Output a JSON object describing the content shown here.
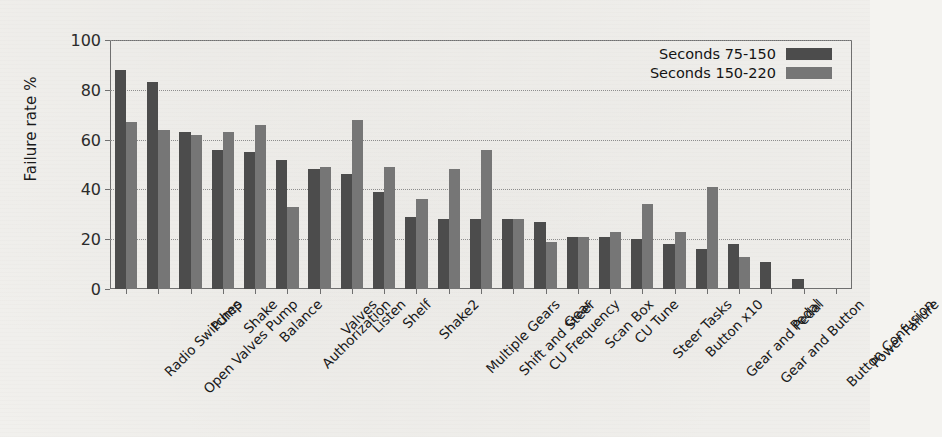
{
  "chart_data": {
    "type": "bar",
    "title": "",
    "xlabel": "",
    "ylabel": "Failure rate %",
    "ylim": [
      0,
      100
    ],
    "yticks": [
      0,
      20,
      40,
      60,
      80,
      100
    ],
    "grid": true,
    "legend_position": "top-right",
    "categories": [
      "Radio Switches",
      "Open Valves Pump",
      "Pump",
      "Shake",
      "Balance",
      "Authorization",
      "Valves",
      "Listen",
      "Shelf",
      "Shake2",
      "Multiple Gears",
      "Shift and Steer",
      "CU Frequency",
      "Gear",
      "Scan Box",
      "CU Tune",
      "Steer Tasks",
      "Button x10",
      "Gear and Pedal",
      "Gear and Button",
      "Pedal",
      "Button Confusion",
      "Power Failure"
    ],
    "series": [
      {
        "name": "Seconds 75-150",
        "color": "#4c4c4c",
        "values": [
          88,
          83,
          63,
          56,
          55,
          52,
          48,
          46,
          39,
          29,
          28,
          28,
          28,
          27,
          21,
          21,
          20,
          18,
          16,
          18,
          11,
          4,
          0
        ]
      },
      {
        "name": "Seconds 150-220",
        "color": "#767676",
        "values": [
          67,
          64,
          62,
          63,
          66,
          33,
          49,
          68,
          49,
          36,
          48,
          56,
          28,
          19,
          21,
          23,
          34,
          23,
          41,
          13,
          0,
          0,
          0
        ]
      }
    ]
  },
  "legend": {
    "entries": [
      {
        "label": "Seconds 75-150"
      },
      {
        "label": "Seconds 150-220"
      }
    ]
  }
}
